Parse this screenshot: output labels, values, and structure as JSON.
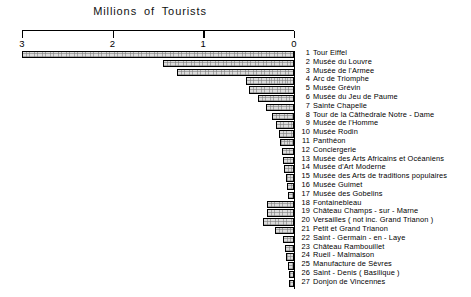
{
  "chart_data": {
    "type": "bar",
    "orientation": "horizontal",
    "title": "Millions  of  Tourists",
    "xlabel": "",
    "ylabel": "",
    "xlim": [
      3,
      0
    ],
    "x_direction": "reversed",
    "grid": false,
    "legend": "right-side numbered list",
    "tick_labels": [
      "3",
      "2",
      "1",
      "0"
    ],
    "tick_values": [
      3,
      2,
      1,
      0
    ],
    "categories": [
      "Tour Eiffel",
      "Musée du Louvre",
      "Musée de l'Armee",
      "Arc de Triomphe",
      "Musée Grévin",
      "Musée du Jeu de Paume",
      "Sainte Chapelle",
      "Tour de la Câthedrale Notre - Dame",
      "Musée de l'Homme",
      "Musée Rodin",
      "Panthéon",
      "Conciergerie",
      "Musée des Arts Africains et Océaniens",
      "Musée d'Art Moderne",
      "Musée des Arts de traditions populaires",
      "Musée Guimet",
      "Musée des Gobelins",
      "Fontainebleau",
      "Château Champs - sur - Marne",
      "Versailles ( not inc. Grand Trianon )",
      "Petit et Grand Trianon",
      "Saint - Germain - en - Laye",
      "Château Rambouillet",
      "Rueil - Malmaison",
      "Manufacture de Sèvres",
      "Saint - Denis ( Basilique )",
      "Donjon de Vincennes"
    ],
    "values": [
      3.0,
      1.45,
      1.29,
      0.53,
      0.5,
      0.4,
      0.31,
      0.24,
      0.2,
      0.17,
      0.15,
      0.13,
      0.12,
      0.11,
      0.09,
      0.08,
      0.07,
      0.3,
      0.3,
      0.34,
      0.21,
      0.12,
      0.1,
      0.09,
      0.07,
      0.06,
      0.05
    ]
  },
  "legend_items": [
    {
      "num": "1",
      "label": "Tour Eiffel"
    },
    {
      "num": "2",
      "label": "Musée du Louvre"
    },
    {
      "num": "3",
      "label": "Musée de l'Armee"
    },
    {
      "num": "4",
      "label": "Arc de Triomphe"
    },
    {
      "num": "5",
      "label": "Musée Grévin"
    },
    {
      "num": "6",
      "label": "Musée du Jeu de Paume"
    },
    {
      "num": "7",
      "label": "Sainte Chapelle"
    },
    {
      "num": "8",
      "label": "Tour de la Câthedrale Notre - Dame"
    },
    {
      "num": "9",
      "label": "Musée de l'Homme"
    },
    {
      "num": "10",
      "label": "Musée Rodin"
    },
    {
      "num": "11",
      "label": "Panthéon"
    },
    {
      "num": "12",
      "label": "Conciergerie"
    },
    {
      "num": "13",
      "label": "Musée des Arts Africains et Océaniens"
    },
    {
      "num": "14",
      "label": "Musée d'Art Moderne"
    },
    {
      "num": "15",
      "label": "Musée des Arts de traditions populaires"
    },
    {
      "num": "16",
      "label": "Musée Guimet"
    },
    {
      "num": "17",
      "label": "Musée des Gobelins"
    },
    {
      "num": "18",
      "label": "Fontainebleau"
    },
    {
      "num": "19",
      "label": "Château Champs - sur - Marne"
    },
    {
      "num": "20",
      "label": "Versailles ( not inc. Grand Trianon )"
    },
    {
      "num": "21",
      "label": "Petit et Grand Trianon"
    },
    {
      "num": "22",
      "label": "Saint - Germain - en - Laye"
    },
    {
      "num": "23",
      "label": "Château Rambouillet"
    },
    {
      "num": "24",
      "label": "Rueil - Malmaison"
    },
    {
      "num": "25",
      "label": "Manufacture de Sèvres"
    },
    {
      "num": "26",
      "label": "Saint - Denis ( Basilique )"
    },
    {
      "num": "27",
      "label": "Donjon de Vincennes"
    }
  ],
  "colors": {
    "bar_fill": "#dcdcdc",
    "bar_stroke": "#000000",
    "axis": "#000000",
    "text": "#000000",
    "background": "#ffffff"
  }
}
